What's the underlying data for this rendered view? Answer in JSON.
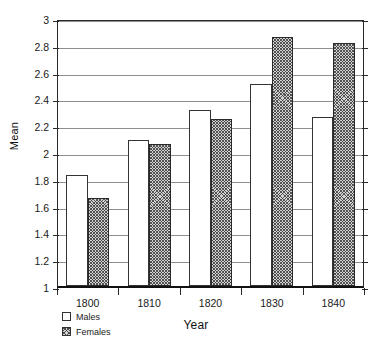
{
  "chart_data": {
    "type": "bar",
    "title": "",
    "xlabel": "Year",
    "ylabel": "Mean",
    "categories": [
      "1800",
      "1810",
      "1820",
      "1830",
      "1840"
    ],
    "series": [
      {
        "name": "Males",
        "values": [
          1.83,
          2.09,
          2.31,
          2.51,
          2.26
        ]
      },
      {
        "name": "Females",
        "values": [
          1.66,
          2.06,
          2.25,
          2.86,
          2.81
        ]
      }
    ],
    "ylim": [
      1,
      3
    ],
    "ytick_labels": [
      "1",
      "1.2",
      "1.4",
      "1.6",
      "1.8",
      "2",
      "2.2",
      "2.4",
      "2.6",
      "2.8",
      "3"
    ],
    "ytick_values": [
      1,
      1.2,
      1.4,
      1.6,
      1.8,
      2,
      2.2,
      2.4,
      2.6,
      2.8,
      3
    ],
    "grid": true,
    "legend_position": "below-left",
    "legend_entries": [
      {
        "label": "Males",
        "swatch": "white-fill"
      },
      {
        "label": "Females",
        "swatch": "hatched-fill"
      }
    ],
    "colors": {
      "males_fill": "#ffffff",
      "females_fill": "#d2d2d2",
      "bar_outline": "#333333",
      "gridline": "#8e8e8e",
      "axis": "#111111",
      "background": "#ffffff"
    }
  }
}
